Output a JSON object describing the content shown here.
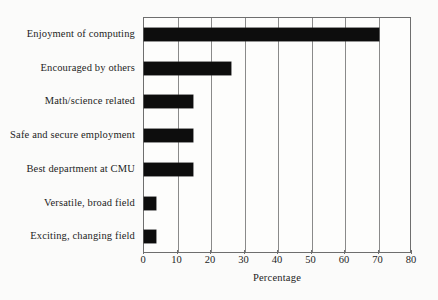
{
  "chart_data": {
    "type": "bar",
    "orientation": "horizontal",
    "title": "",
    "xlabel": "Percentage",
    "ylabel": "",
    "xlim": [
      0,
      80
    ],
    "xticks": [
      0,
      10,
      20,
      30,
      40,
      50,
      60,
      70,
      80
    ],
    "grid": true,
    "legend": null,
    "bar_color": "#0d0d0d",
    "background_color": "#fbfbfa",
    "axis_color": "#6e6e6e",
    "categories": [
      "Enjoyment of computing",
      "Encouraged by others",
      "Math/science related",
      "Safe and secure employment",
      "Best department at CMU",
      "Versatile, broad field",
      "Exciting, changing field"
    ],
    "values": [
      70,
      26,
      14.6,
      14.6,
      14.6,
      3.6,
      3.6
    ]
  }
}
